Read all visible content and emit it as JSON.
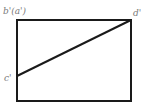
{
  "diagram": {
    "type": "orthographic-projection",
    "colors": {
      "stroke": "#1a1a1a",
      "label": "#7a7a7a",
      "background": "#ffffff"
    },
    "rectangle": {
      "x1": 17,
      "y1": 20,
      "x2": 131,
      "y2": 101
    },
    "line": {
      "from": "c'",
      "to": "d'",
      "x1": 17,
      "y1": 76,
      "x2": 131,
      "y2": 20
    },
    "labels": {
      "top_left": "b'(a')",
      "top_right": "d'",
      "left": "c'"
    }
  }
}
